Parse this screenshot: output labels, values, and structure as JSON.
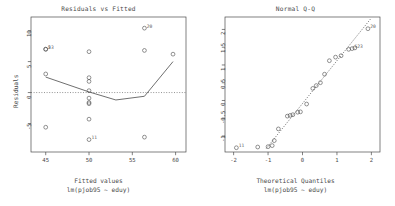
{
  "figure": {
    "device": "R graphics device",
    "background": "#ffffff",
    "foreground": "#4a4a4a",
    "layout": "1 row x 2 columns"
  },
  "chart_data": [
    {
      "type": "scatter",
      "name": "residuals-vs-fitted",
      "title": "Residuals vs Fitted",
      "xlabel": "Fitted values",
      "sublabel": "lm(pjob95 ~ eduy)",
      "ylabel": "Residuals",
      "xlim": [
        43.3,
        61.2
      ],
      "ylim": [
        -9.6,
        12.2
      ],
      "xticks": [
        45,
        50,
        55,
        60
      ],
      "yticks": [
        10,
        5,
        0,
        -5
      ],
      "grid": false,
      "legend": null,
      "point_symbol": "open-circle",
      "points": [
        {
          "x": 45.0,
          "y": 7.0,
          "label": "5"
        },
        {
          "x": 45.0,
          "y": 7.0,
          "label": "23"
        },
        {
          "x": 45.0,
          "y": 3.0,
          "label": ""
        },
        {
          "x": 45.0,
          "y": -5.6,
          "label": ""
        },
        {
          "x": 50.0,
          "y": 6.6,
          "label": ""
        },
        {
          "x": 50.0,
          "y": 2.4,
          "label": ""
        },
        {
          "x": 50.0,
          "y": 1.8,
          "label": ""
        },
        {
          "x": 50.0,
          "y": 0.3,
          "label": ""
        },
        {
          "x": 50.0,
          "y": -0.9,
          "label": ""
        },
        {
          "x": 50.0,
          "y": -1.6,
          "label": ""
        },
        {
          "x": 50.0,
          "y": -1.8,
          "label": ""
        },
        {
          "x": 50.0,
          "y": -4.3,
          "label": ""
        },
        {
          "x": 50.0,
          "y": -7.6,
          "label": "11"
        },
        {
          "x": 56.4,
          "y": 10.4,
          "label": "20"
        },
        {
          "x": 56.4,
          "y": 6.8,
          "label": ""
        },
        {
          "x": 56.4,
          "y": -7.2,
          "label": ""
        },
        {
          "x": 59.7,
          "y": 6.2,
          "label": ""
        }
      ],
      "smoother": {
        "kind": "lowess",
        "style": "solid",
        "points": [
          {
            "x": 45.0,
            "y": 2.5
          },
          {
            "x": 50.0,
            "y": 0.1
          },
          {
            "x": 53.1,
            "y": -1.2
          },
          {
            "x": 56.4,
            "y": -0.6
          },
          {
            "x": 59.7,
            "y": 5.0
          }
        ]
      },
      "reference_line": {
        "kind": "zero-dotted",
        "y": 0,
        "style": "dotted"
      }
    },
    {
      "type": "scatter",
      "name": "normal-q-q",
      "title": "Normal Q-Q",
      "xlabel": "Theoretical Quantiles",
      "sublabel": "lm(pjob95 ~ eduy)",
      "ylabel": "Standardized residuals",
      "xlim": [
        -2.25,
        2.25
      ],
      "ylim": [
        -1.45,
        2.35
      ],
      "xticks": [
        -2,
        -1,
        0,
        1,
        2
      ],
      "yticks": [
        2.0,
        1.5,
        1.0,
        0.5,
        0.0,
        -0.5,
        -1.0
      ],
      "grid": false,
      "legend": null,
      "point_symbol": "open-circle",
      "points": [
        {
          "x": -1.92,
          "y": -1.33,
          "label": "11"
        },
        {
          "x": -1.3,
          "y": -1.31,
          "label": ""
        },
        {
          "x": -1.0,
          "y": -1.3,
          "label": ""
        },
        {
          "x": -0.88,
          "y": -1.27,
          "label": ""
        },
        {
          "x": -0.82,
          "y": -1.13,
          "label": ""
        },
        {
          "x": -0.7,
          "y": -0.8,
          "label": ""
        },
        {
          "x": -0.44,
          "y": -0.44,
          "label": ""
        },
        {
          "x": -0.36,
          "y": -0.42,
          "label": ""
        },
        {
          "x": -0.28,
          "y": -0.4,
          "label": ""
        },
        {
          "x": -0.14,
          "y": -0.33,
          "label": ""
        },
        {
          "x": -0.06,
          "y": -0.32,
          "label": ""
        },
        {
          "x": 0.12,
          "y": -0.1,
          "label": ""
        },
        {
          "x": 0.3,
          "y": 0.34,
          "label": ""
        },
        {
          "x": 0.4,
          "y": 0.42,
          "label": ""
        },
        {
          "x": 0.52,
          "y": 0.5,
          "label": ""
        },
        {
          "x": 0.64,
          "y": 0.74,
          "label": ""
        },
        {
          "x": 0.78,
          "y": 1.12,
          "label": ""
        },
        {
          "x": 0.96,
          "y": 1.22,
          "label": ""
        },
        {
          "x": 1.12,
          "y": 1.26,
          "label": ""
        },
        {
          "x": 1.34,
          "y": 1.44,
          "label": ""
        },
        {
          "x": 1.44,
          "y": 1.46,
          "label": "5"
        },
        {
          "x": 1.52,
          "y": 1.48,
          "label": "23"
        },
        {
          "x": 1.9,
          "y": 2.02,
          "label": "20"
        }
      ],
      "reference_line": {
        "kind": "qq-line",
        "style": "dotted",
        "points": [
          {
            "x": -1.05,
            "y": -1.35
          },
          {
            "x": 1.98,
            "y": 2.3
          }
        ]
      }
    }
  ]
}
